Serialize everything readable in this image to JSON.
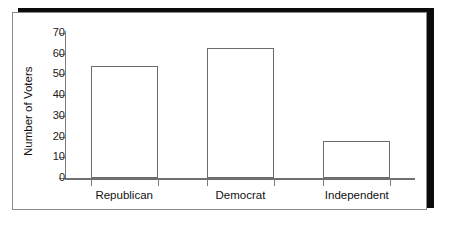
{
  "figure": {
    "name": "voters-by-party-bar-chart",
    "frame_border_color": "#8a8a8a",
    "shadow_color": "#0b0b0b",
    "bar_outline_color": "#6b6b6b",
    "bar_fill_color": "#ffffff",
    "axis_color": "#7b7b7b"
  },
  "chart_data": {
    "type": "bar",
    "title": "",
    "xlabel": "",
    "ylabel": "Number of Voters",
    "categories": [
      "Republican",
      "Democrat",
      "Independent"
    ],
    "values": [
      54,
      63,
      18
    ],
    "ylim": [
      0,
      70
    ],
    "yticks": [
      0,
      10,
      20,
      30,
      40,
      50,
      60,
      70
    ],
    "ytick_labels": [
      "0",
      "10",
      "20",
      "30",
      "40",
      "50",
      "60",
      "70"
    ],
    "grid": false,
    "legend": null,
    "orientation": "vertical",
    "bar_style": "outlined-unfilled"
  }
}
